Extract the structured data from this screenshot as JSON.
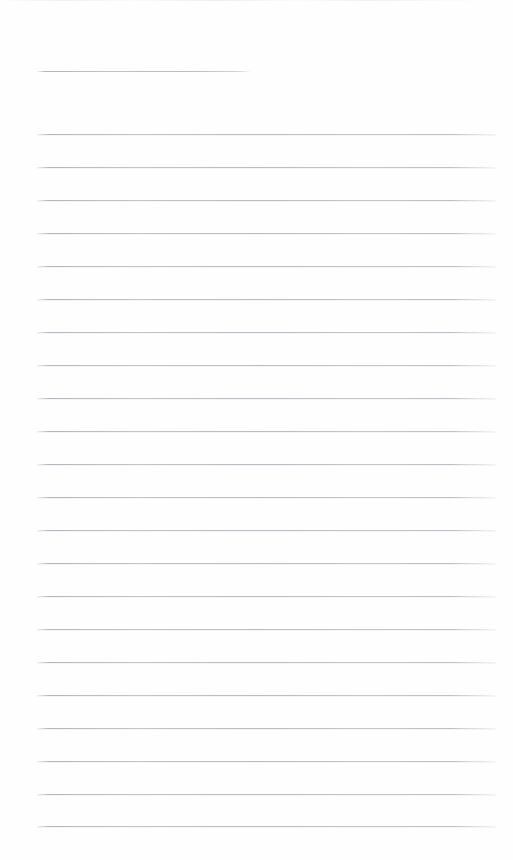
{
  "document": {
    "kind": "ruled-notepaper",
    "description": "Blank lined writing paper page",
    "width": 513,
    "height": 860,
    "background_color": "#fefeff",
    "rule_color": "#c2c2c9",
    "top_edge_rule_color": "#ededf1",
    "page_text": ""
  },
  "top_edge_rule": {
    "name": "top-edge-rule",
    "y": 0,
    "x_start": 0,
    "x_end": 513,
    "visible": true
  },
  "title_rule": {
    "name": "title-rule",
    "y": 71,
    "x_start": 37,
    "x_end": 250,
    "width": 213,
    "label": ""
  },
  "rules": {
    "count": 22,
    "x_start": 37,
    "x_end": 496,
    "width": 459,
    "first_y": 134,
    "spacing": 32.95,
    "lines": [
      {
        "index": 1,
        "y": 134,
        "text": ""
      },
      {
        "index": 2,
        "y": 167,
        "text": ""
      },
      {
        "index": 3,
        "y": 200,
        "text": ""
      },
      {
        "index": 4,
        "y": 233,
        "text": ""
      },
      {
        "index": 5,
        "y": 266,
        "text": ""
      },
      {
        "index": 6,
        "y": 299,
        "text": ""
      },
      {
        "index": 7,
        "y": 332,
        "text": ""
      },
      {
        "index": 8,
        "y": 365,
        "text": ""
      },
      {
        "index": 9,
        "y": 398,
        "text": ""
      },
      {
        "index": 10,
        "y": 431,
        "text": ""
      },
      {
        "index": 11,
        "y": 464,
        "text": ""
      },
      {
        "index": 12,
        "y": 497,
        "text": ""
      },
      {
        "index": 13,
        "y": 530,
        "text": ""
      },
      {
        "index": 14,
        "y": 563,
        "text": ""
      },
      {
        "index": 15,
        "y": 596,
        "text": ""
      },
      {
        "index": 16,
        "y": 629,
        "text": ""
      },
      {
        "index": 17,
        "y": 662,
        "text": ""
      },
      {
        "index": 18,
        "y": 695,
        "text": ""
      },
      {
        "index": 19,
        "y": 728,
        "text": ""
      },
      {
        "index": 20,
        "y": 761,
        "text": ""
      },
      {
        "index": 21,
        "y": 794,
        "text": ""
      },
      {
        "index": 22,
        "y": 826,
        "text": ""
      }
    ]
  }
}
